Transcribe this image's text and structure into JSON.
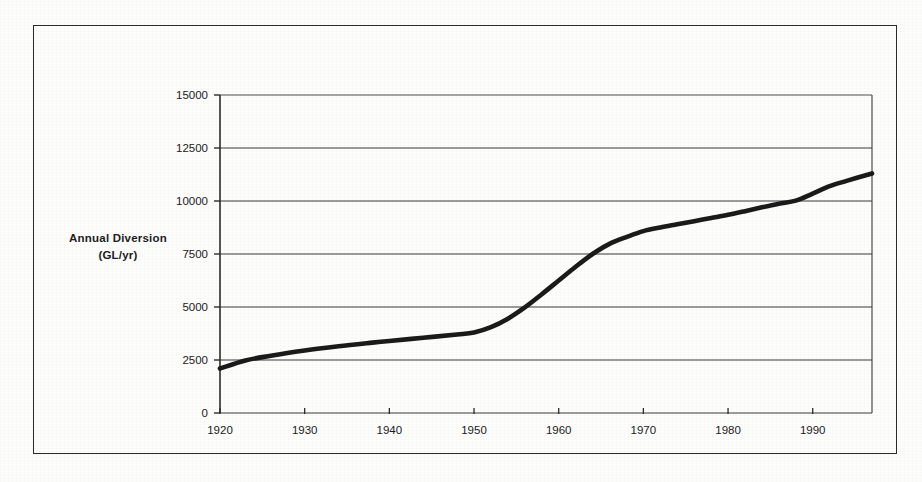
{
  "chart_data": {
    "type": "line",
    "title": "",
    "xlabel": "",
    "ylabel": "Annual Diversion\n(GL/yr)",
    "ylabel_line1": "Annual Diversion",
    "ylabel_line2": "(GL/yr)",
    "xlim": [
      1920,
      1997
    ],
    "ylim": [
      0,
      15000
    ],
    "grid": true,
    "legend": false,
    "line_color": "#1a1a1a",
    "gridline_color": "#3b3b3b",
    "x_tick_labels": [
      "1920",
      "1930",
      "1940",
      "1950",
      "1960",
      "1970",
      "1980",
      "1990"
    ],
    "x_ticks": [
      1920,
      1930,
      1940,
      1950,
      1960,
      1970,
      1980,
      1990
    ],
    "y_tick_labels": [
      "0",
      "2500",
      "5000",
      "7500",
      "10000",
      "12500",
      "15000"
    ],
    "y_ticks": [
      0,
      2500,
      5000,
      7500,
      10000,
      12500,
      15000
    ],
    "series": [
      {
        "name": "Annual Diversion",
        "x": [
          1920,
          1923,
          1926,
          1930,
          1934,
          1938,
          1940,
          1944,
          1948,
          1950,
          1952,
          1954,
          1956,
          1958,
          1960,
          1962,
          1964,
          1966,
          1968,
          1970,
          1972,
          1974,
          1976,
          1978,
          1980,
          1982,
          1984,
          1986,
          1988,
          1990,
          1992,
          1994,
          1997
        ],
        "values": [
          2100,
          2480,
          2700,
          2950,
          3150,
          3320,
          3400,
          3550,
          3700,
          3800,
          4050,
          4450,
          4980,
          5600,
          6250,
          6900,
          7500,
          7980,
          8300,
          8580,
          8750,
          8900,
          9050,
          9200,
          9350,
          9520,
          9700,
          9870,
          10020,
          10350,
          10700,
          10950,
          11300
        ]
      }
    ]
  },
  "axis": {
    "y_label_line1": "Annual Diversion",
    "y_label_line2": "(GL/yr)"
  }
}
